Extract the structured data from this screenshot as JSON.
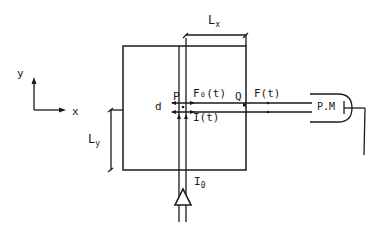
{
  "diagram": {
    "axes": {
      "x_label": "x",
      "y_label": "y"
    },
    "dimensions": {
      "lx": {
        "main": "L",
        "sub": "x"
      },
      "ly": {
        "main": "L",
        "sub": "y"
      }
    },
    "labels": {
      "p": "P",
      "q": "Q",
      "d": "d",
      "f0t": "F₀(t)",
      "ft": "F(t)",
      "it": "I(t)",
      "i0_main": "I",
      "i0_sub": "0",
      "pm": "P.M"
    },
    "colors": {
      "ink": "#1a1a1a",
      "background": "#ffffff"
    }
  }
}
